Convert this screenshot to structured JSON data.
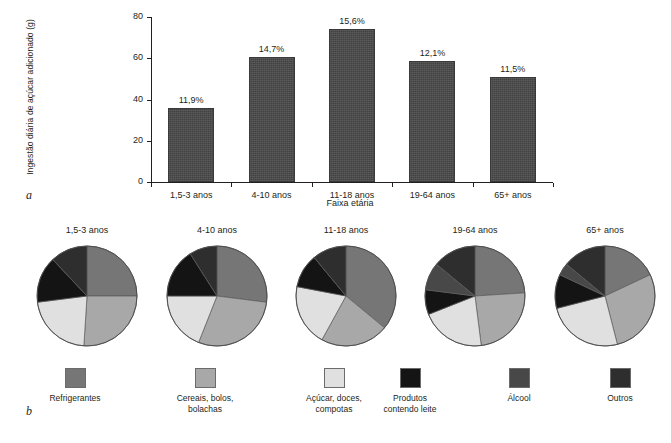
{
  "panels": {
    "a": "a",
    "b": "b"
  },
  "chart_data": [
    {
      "type": "bar",
      "panel": "a",
      "title": "",
      "xlabel": "Faixa etária",
      "ylabel": "Ingestão diária de açúcar adicionado (g)",
      "categories": [
        "1,5-3 anos",
        "4-10 anos",
        "11-18 anos",
        "19-64 anos",
        "65+ anos"
      ],
      "values": [
        36,
        60.5,
        74,
        58.5,
        51
      ],
      "data_labels": [
        "11,9%",
        "14,7%",
        "15,6%",
        "12,1%",
        "11,5%"
      ],
      "ylim": [
        0,
        80
      ],
      "yticks": [
        "0",
        "20",
        "40",
        "60",
        "80"
      ],
      "ytick_values": [
        0,
        20,
        40,
        60,
        80
      ],
      "grid": false,
      "legend": "none",
      "bar_color": "#4a4a4a"
    },
    {
      "type": "pie",
      "panel": "b",
      "legend_position": "bottom",
      "categories": [
        "Refrigerantes",
        "Cereais, bolos, bolachas",
        "Açúcar, doces, compotas",
        "Produtos contendo leite",
        "Álcool",
        "Outros"
      ],
      "colors": [
        "#767676",
        "#a8a8a8",
        "#e0e0e0",
        "#141414",
        "#484848",
        "#2e2e2e"
      ],
      "pies": [
        {
          "title": "1,5-3 anos",
          "values": [
            25,
            26,
            22,
            15,
            0,
            12
          ]
        },
        {
          "title": "4-10 anos",
          "values": [
            27,
            29,
            19,
            16,
            0,
            9
          ]
        },
        {
          "title": "11-18 anos",
          "values": [
            36,
            22,
            20,
            11,
            0,
            11
          ]
        },
        {
          "title": "19-64 anos",
          "values": [
            24,
            24,
            21,
            8,
            9,
            14
          ]
        },
        {
          "title": "65+ anos",
          "values": [
            18,
            28,
            25,
            11,
            4,
            14
          ]
        }
      ]
    }
  ],
  "legend": {
    "items": [
      {
        "label": "Refrigerantes",
        "color": "#767676"
      },
      {
        "label": "Cereais, bolos,\nbolachas",
        "color": "#a8a8a8"
      },
      {
        "label": "Açúcar, doces,\ncompotas",
        "color": "#e0e0e0"
      },
      {
        "label": "Produtos\ncontendo leite",
        "color": "#141414"
      },
      {
        "label": "Álcool",
        "color": "#484848"
      },
      {
        "label": "Outros",
        "color": "#2e2e2e"
      }
    ]
  }
}
